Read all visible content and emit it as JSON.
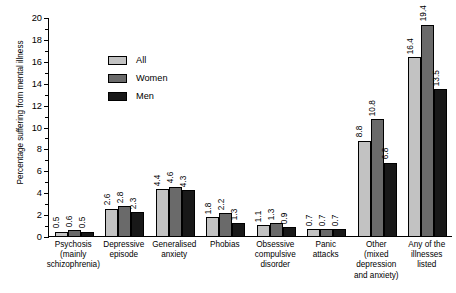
{
  "chart_data": {
    "type": "bar",
    "title": "",
    "xlabel": "",
    "ylabel": "Percentage suffering from mental illness",
    "ylim": [
      0,
      20
    ],
    "ytick_step": 2,
    "yticks": [
      "0",
      "2",
      "4",
      "6",
      "8",
      "10",
      "12",
      "14",
      "16",
      "18",
      "20"
    ],
    "grid": false,
    "legend_position": "inside-upper-left",
    "categories": [
      "Psychosis (mainly schizophrenia)",
      "Depressive episode",
      "Generalised anxiety",
      "Phobias",
      "Obsessive compulsive disorder",
      "Panic attacks",
      "Other (mixed depression and anxiety)",
      "Any of the illnesses listed"
    ],
    "category_lines": [
      [
        "Psychosis",
        "(mainly",
        "schizophrenia)"
      ],
      [
        "Depressive",
        "episode"
      ],
      [
        "Generalised",
        "anxiety"
      ],
      [
        "Phobias"
      ],
      [
        "Obsessive",
        "compulsive",
        "disorder"
      ],
      [
        "Panic",
        "attacks"
      ],
      [
        "Other",
        "(mixed",
        "depression",
        "and anxiety)"
      ],
      [
        "Any of the",
        "illnesses",
        "listed"
      ]
    ],
    "series": [
      {
        "name": "All",
        "color": "#c2c2c2",
        "values": [
          0.5,
          2.6,
          4.4,
          1.8,
          1.1,
          0.7,
          8.8,
          16.4
        ],
        "labels": [
          "0.5",
          "2.6",
          "4.4",
          "1.8",
          "1.1",
          "0.7",
          "8.8",
          "16.4"
        ]
      },
      {
        "name": "Women",
        "color": "#6a6a6a",
        "values": [
          0.6,
          2.8,
          4.6,
          2.2,
          1.3,
          0.7,
          10.8,
          19.4
        ],
        "labels": [
          "0.6",
          "2.8",
          "4.6",
          "2.2",
          "1.3",
          "0.7",
          "10.8",
          "19.4"
        ]
      },
      {
        "name": "Men",
        "color": "#181818",
        "values": [
          0.5,
          2.3,
          4.3,
          1.3,
          0.9,
          0.7,
          6.8,
          13.5
        ],
        "labels": [
          "0.5",
          "2.3",
          "4.3",
          "1.3",
          "0.9",
          "0.7",
          "6.8",
          "13.5"
        ]
      }
    ]
  }
}
